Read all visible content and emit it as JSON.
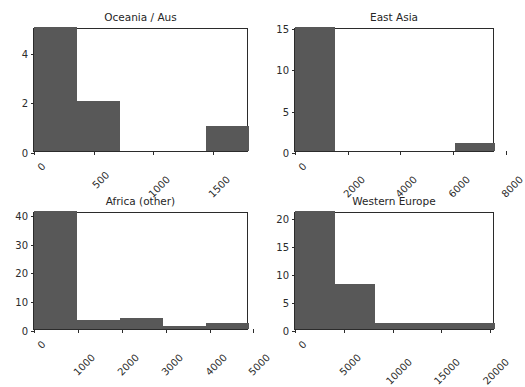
{
  "figure": {
    "suptitle": "",
    "background_color": "#ffffff",
    "bar_color": "#585858",
    "axis_color": "#2b2b2b",
    "text_color": "#2b2b2b",
    "title_color": "#262626",
    "grid": false,
    "rows": 2,
    "cols": 2
  },
  "chart_data": [
    {
      "type": "bar",
      "title": "Oceania / Aus",
      "xlabel": "",
      "ylabel": "",
      "xlim": [
        0,
        1800
      ],
      "ylim": [
        0,
        5
      ],
      "xticks": [
        0,
        500,
        1000,
        1500
      ],
      "xtick_labels": [
        "0",
        "500",
        "1000",
        "1500"
      ],
      "yticks": [
        0,
        2,
        4
      ],
      "ytick_labels": [
        "0",
        "2",
        "4"
      ],
      "bin_edges": [
        0,
        360,
        720,
        1080,
        1440,
        1800
      ],
      "categories": [
        "0-360",
        "360-720",
        "720-1080",
        "1080-1440",
        "1440-1800"
      ],
      "values": [
        5,
        2,
        0,
        0,
        1
      ],
      "grid": false,
      "legend": null
    },
    {
      "type": "bar",
      "title": "East Asia",
      "xlabel": "",
      "ylabel": "",
      "xlim": [
        0,
        7600
      ],
      "ylim": [
        0,
        15
      ],
      "xticks": [
        0,
        2000,
        4000,
        6000,
        8000
      ],
      "xtick_labels": [
        "0",
        "2000",
        "4000",
        "6000",
        "8000"
      ],
      "yticks": [
        0,
        5,
        10,
        15
      ],
      "ytick_labels": [
        "0",
        "5",
        "10",
        "15"
      ],
      "bin_edges": [
        0,
        1520,
        3040,
        4560,
        6080,
        7600
      ],
      "categories": [
        "0-1520",
        "1520-3040",
        "3040-4560",
        "4560-6080",
        "6080-7600"
      ],
      "values": [
        15,
        0,
        0,
        0,
        1
      ],
      "grid": false,
      "legend": null
    },
    {
      "type": "bar",
      "title": "Africa (other)",
      "xlabel": "",
      "ylabel": "",
      "xlim": [
        0,
        4900
      ],
      "ylim": [
        0,
        41
      ],
      "xticks": [
        0,
        1000,
        2000,
        3000,
        4000,
        5000
      ],
      "xtick_labels": [
        "0",
        "1000",
        "2000",
        "3000",
        "4000",
        "5000"
      ],
      "yticks": [
        0,
        10,
        20,
        30,
        40
      ],
      "ytick_labels": [
        "0",
        "10",
        "20",
        "30",
        "40"
      ],
      "bin_edges": [
        0,
        980,
        1960,
        2940,
        3920,
        4900
      ],
      "categories": [
        "0-980",
        "980-1960",
        "1960-2940",
        "2940-3920",
        "3920-4900"
      ],
      "values": [
        41,
        3,
        4,
        1,
        2
      ],
      "grid": false,
      "legend": null
    },
    {
      "type": "bar",
      "title": "Western Europe",
      "xlabel": "",
      "ylabel": "",
      "xlim": [
        0,
        20500
      ],
      "ylim": [
        0,
        21
      ],
      "xticks": [
        0,
        5000,
        10000,
        15000,
        20000
      ],
      "xtick_labels": [
        "0",
        "5000",
        "10000",
        "15000",
        "20000"
      ],
      "yticks": [
        0,
        5,
        10,
        15,
        20
      ],
      "ytick_labels": [
        "0",
        "5",
        "10",
        "15",
        "20"
      ],
      "bin_edges": [
        0,
        4100,
        8200,
        12300,
        16400,
        20500
      ],
      "categories": [
        "0-4100",
        "4100-8200",
        "8200-12300",
        "12300-16400",
        "16400-20500"
      ],
      "values": [
        21,
        8,
        1,
        1,
        1
      ],
      "grid": false,
      "legend": null
    }
  ],
  "panel_geometry": [
    {
      "left": 33,
      "top": 28,
      "width": 215,
      "height": 124,
      "title_top": 11
    },
    {
      "left": 294,
      "top": 28,
      "width": 200,
      "height": 124,
      "title_top": 11
    },
    {
      "left": 33,
      "top": 212,
      "width": 215,
      "height": 118,
      "title_top": 195
    },
    {
      "left": 294,
      "top": 212,
      "width": 200,
      "height": 118,
      "title_top": 195
    }
  ]
}
